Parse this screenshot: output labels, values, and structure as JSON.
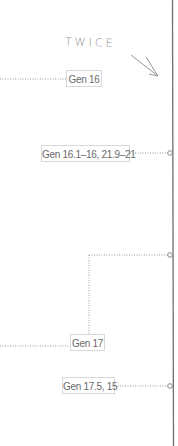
{
  "annotation": {
    "text": "TWICE"
  },
  "labels": [
    {
      "id": "gen16",
      "text": "Gen 16"
    },
    {
      "id": "gen16-1-16",
      "text": "Gen 16.1–16, 21.9–21"
    },
    {
      "id": "gen17",
      "text": "Gen 17"
    },
    {
      "id": "gen17-5-15",
      "text": "Gen 17.5, 15"
    }
  ],
  "colors": {
    "line": "#9a9a9a",
    "timeline": "#6e6e6e",
    "box_border": "#d8d8d8",
    "text": "#6a6a6a"
  }
}
